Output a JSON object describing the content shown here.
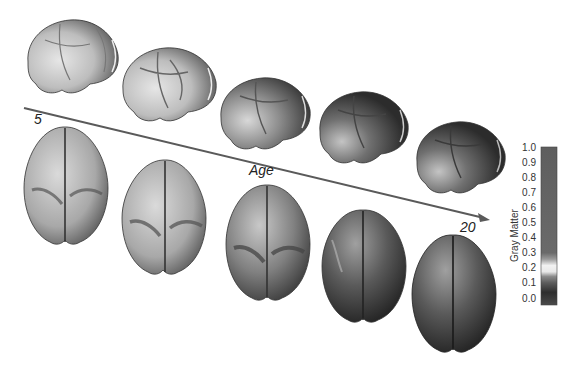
{
  "figure": {
    "age_axis": {
      "label": "Age",
      "start_label": "5",
      "end_label": "20",
      "line_color": "#5a5a5a"
    },
    "lateral_views": [
      {
        "index": 1,
        "age_stage": "youngest"
      },
      {
        "index": 2,
        "age_stage": "early"
      },
      {
        "index": 3,
        "age_stage": "middle"
      },
      {
        "index": 4,
        "age_stage": "late"
      },
      {
        "index": 5,
        "age_stage": "oldest"
      }
    ],
    "top_views": [
      {
        "index": 1,
        "age_stage": "youngest"
      },
      {
        "index": 2,
        "age_stage": "early"
      },
      {
        "index": 3,
        "age_stage": "middle"
      },
      {
        "index": 4,
        "age_stage": "late"
      },
      {
        "index": 5,
        "age_stage": "oldest"
      }
    ],
    "colorbar": {
      "title": "Gray Matter",
      "ticks": [
        "1.0",
        "0.9",
        "0.8",
        "0.7",
        "0.6",
        "0.5",
        "0.4",
        "0.3",
        "0.2",
        "0.1",
        "0.0"
      ],
      "min": 0.0,
      "max": 1.0
    }
  }
}
